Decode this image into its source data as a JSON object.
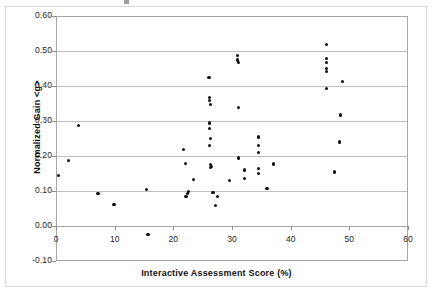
{
  "figure": {
    "background_color": "#ffffff",
    "frame_color": "#d9d9d9",
    "plot_border_color": "#a6a6a6",
    "gridline_color": "#bfbfbf",
    "marker_color": "#111111"
  },
  "chart_data": {
    "type": "scatter",
    "title": "",
    "xlabel": "Interactive Assessment Score (%)",
    "ylabel": "Normalized Gain <g>",
    "xlim": [
      0,
      60
    ],
    "ylim": [
      -0.1,
      0.6
    ],
    "xticks": [
      0,
      10,
      20,
      30,
      40,
      50,
      60
    ],
    "xtick_labels": [
      "0",
      "10",
      "20",
      "30",
      "40",
      "50",
      "60"
    ],
    "yticks": [
      -0.1,
      0.0,
      0.1,
      0.2,
      0.3,
      0.4,
      0.5,
      0.6
    ],
    "ytick_labels": [
      "-0.10",
      "0.00",
      "0.10",
      "0.20",
      "0.30",
      "0.40",
      "0.50",
      "0.60"
    ],
    "grid": "horizontal",
    "legend": null,
    "series": [
      {
        "name": "Students",
        "marker": "circle",
        "points": [
          [
            0.2,
            0.147
          ],
          [
            2.0,
            0.191
          ],
          [
            3.7,
            0.291
          ],
          [
            7.0,
            0.095
          ],
          [
            9.7,
            0.065
          ],
          [
            15.3,
            0.108
          ],
          [
            15.5,
            -0.022
          ],
          [
            21.6,
            0.222
          ],
          [
            21.9,
            0.182
          ],
          [
            22.0,
            0.088
          ],
          [
            22.3,
            0.096
          ],
          [
            22.4,
            0.101
          ],
          [
            23.2,
            0.136
          ],
          [
            25.9,
            0.428
          ],
          [
            26.0,
            0.369
          ],
          [
            26.0,
            0.362
          ],
          [
            26.1,
            0.35
          ],
          [
            26.0,
            0.297
          ],
          [
            26.0,
            0.281
          ],
          [
            26.1,
            0.252
          ],
          [
            26.0,
            0.232
          ],
          [
            26.2,
            0.178
          ],
          [
            26.2,
            0.17
          ],
          [
            26.4,
            0.172
          ],
          [
            26.6,
            0.098
          ],
          [
            27.0,
            0.062
          ],
          [
            27.4,
            0.086
          ],
          [
            29.4,
            0.134
          ],
          [
            30.7,
            0.49
          ],
          [
            30.8,
            0.477
          ],
          [
            30.9,
            0.471
          ],
          [
            30.9,
            0.341
          ],
          [
            30.9,
            0.197
          ],
          [
            31.9,
            0.163
          ],
          [
            32.0,
            0.138
          ],
          [
            34.3,
            0.257
          ],
          [
            34.4,
            0.232
          ],
          [
            34.3,
            0.212
          ],
          [
            34.4,
            0.166
          ],
          [
            34.4,
            0.152
          ],
          [
            35.8,
            0.111
          ],
          [
            36.9,
            0.18
          ],
          [
            45.9,
            0.521
          ],
          [
            46.0,
            0.481
          ],
          [
            46.0,
            0.471
          ],
          [
            46.0,
            0.452
          ],
          [
            46.0,
            0.445
          ],
          [
            46.0,
            0.395
          ],
          [
            47.3,
            0.157
          ],
          [
            48.1,
            0.243
          ],
          [
            48.3,
            0.32
          ],
          [
            48.6,
            0.416
          ]
        ]
      }
    ]
  }
}
